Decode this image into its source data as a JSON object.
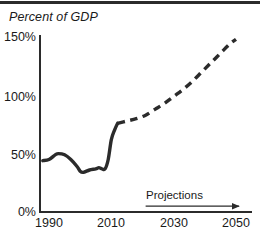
{
  "header": {
    "rule_color": "#2b2b2b"
  },
  "chart_data": {
    "type": "line",
    "title": "Percent of GDP",
    "xlabel": "",
    "ylabel": "Percent of GDP",
    "xlim": [
      1988,
      2051
    ],
    "ylim": [
      0,
      150
    ],
    "grid": false,
    "legend": "none",
    "y_ticks": [
      "0%",
      "50%",
      "100%",
      "150%"
    ],
    "y_tick_values": [
      0,
      50,
      100,
      150
    ],
    "x_ticks": [
      "1990",
      "2010",
      "2030",
      "2050"
    ],
    "x_tick_values": [
      1990,
      2010,
      2030,
      2050
    ],
    "line_color": "#2b2b2b",
    "annotation": {
      "label": "Projections",
      "arrow_from_year": 2021,
      "arrow_to_year": 2051,
      "arrow_y_percent": 5
    },
    "series": [
      {
        "name": "Federal debt held by the public",
        "style": "solid",
        "segment": "historical",
        "x": [
          1988,
          1990,
          1992,
          1993,
          1995,
          1997,
          1999,
          2000,
          2001,
          2003,
          2005,
          2006,
          2007,
          2008,
          2009,
          2010,
          2011,
          2012
        ],
        "values": [
          44,
          45,
          49,
          50,
          49,
          45,
          39,
          35,
          34,
          36,
          37,
          38,
          37,
          37,
          45,
          62,
          70,
          76
        ]
      },
      {
        "name": "Federal debt held by the public",
        "style": "dashed",
        "segment": "projected",
        "x": [
          2012,
          2015,
          2018,
          2021,
          2024,
          2027,
          2030,
          2033,
          2036,
          2039,
          2042,
          2045,
          2048,
          2050
        ],
        "values": [
          76,
          78,
          80,
          83,
          88,
          93,
          99,
          105,
          112,
          120,
          128,
          136,
          144,
          148
        ]
      }
    ]
  }
}
